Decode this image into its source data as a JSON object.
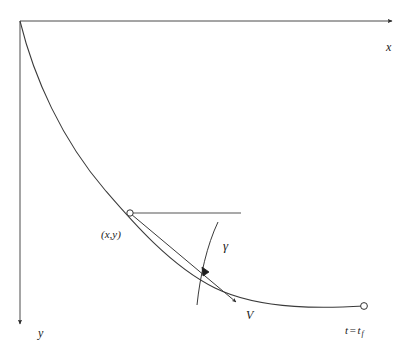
{
  "figure": {
    "type": "diagram",
    "background_color": "#ffffff",
    "stroke_color": "#333333",
    "labels": {
      "x_axis": "x",
      "y_axis": "y",
      "point": "(x,y)",
      "flight_path_angle": "γ",
      "velocity": "V",
      "final_time_prefix": "t",
      "final_time_equals": "=",
      "final_time_value": "t",
      "final_time_subscript": "f"
    },
    "geometry": {
      "origin": [
        20,
        21
      ],
      "x_axis_end": [
        395,
        21
      ],
      "y_axis_end": [
        20,
        327
      ],
      "curve_start": [
        20,
        21
      ],
      "curve_end": [
        364,
        306
      ],
      "point_marker": [
        130,
        213
      ],
      "horizontal_reference_end": [
        241,
        213
      ],
      "velocity_arrow_end": [
        240,
        305
      ],
      "angle_arc_top": [
        218,
        222
      ],
      "angle_arc_bottom": [
        198,
        305
      ],
      "marker_radius": 3.2
    },
    "annotations": {
      "point_marker_style": "open-circle",
      "endpoint_marker_style": "open-circle",
      "angle_indicator": "filled-arrowhead"
    }
  }
}
